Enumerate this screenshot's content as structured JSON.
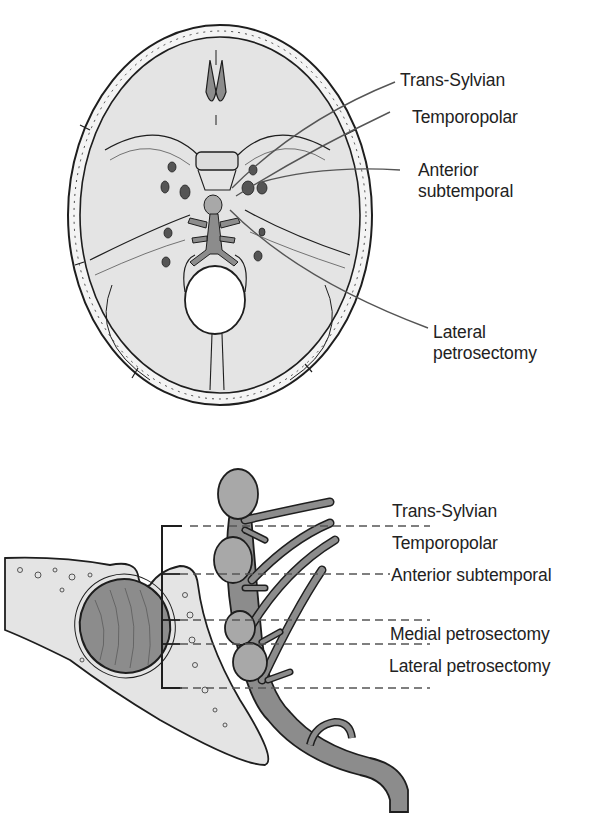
{
  "figure": {
    "top_panel": {
      "title": "Skull base, superior view",
      "labels": [
        {
          "id": "trans-sylvian",
          "line1": "Trans-Sylvian",
          "line2": ""
        },
        {
          "id": "temporopolar",
          "line1": "Temporopolar",
          "line2": ""
        },
        {
          "id": "anterior-subtemporal",
          "line1": "Anterior",
          "line2": "subtemporal"
        },
        {
          "id": "lateral-petrosectomy",
          "line1": "Lateral",
          "line2": "petrosectomy"
        }
      ]
    },
    "bottom_panel": {
      "title": "Lateral view, basilar artery and clivus",
      "labels": [
        {
          "id": "trans-sylvian",
          "text": "Trans-Sylvian"
        },
        {
          "id": "temporopolar",
          "text": "Temporopolar"
        },
        {
          "id": "anterior-subtemporal",
          "text": "Anterior subtemporal"
        },
        {
          "id": "medial-petrosectomy",
          "text": "Medial petrosectomy"
        },
        {
          "id": "lateral-petrosectomy",
          "text": "Lateral petrosectomy"
        }
      ]
    },
    "colors": {
      "bone_fill": "#e4e4e4",
      "vessel_fill": "#8c8c8c",
      "aneurysm_fill": "#a8a8a8",
      "ink": "#1e1e1e",
      "leader_line": "#555555",
      "background": "#ffffff"
    }
  }
}
